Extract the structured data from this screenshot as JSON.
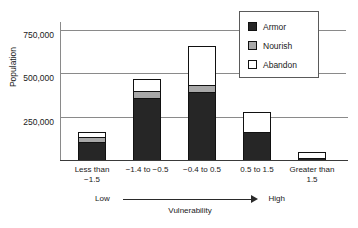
{
  "chart_data": {
    "type": "bar",
    "subtype": "stacked-bar",
    "title": "",
    "xlabel": "Vulnerability",
    "ylabel": "Population",
    "ylim": [
      0,
      800000
    ],
    "yticks": [
      250000,
      500000,
      750000
    ],
    "ytick_labels": [
      "250,000",
      "500,000",
      "750,000"
    ],
    "grid": true,
    "legend_position": "top-right",
    "categories": [
      "Less than\n−1.5",
      "−1.4 to −0.5",
      "−0.4  to 0.5",
      "0.5  to 1.5",
      "Greater than\n1.5"
    ],
    "series": [
      {
        "name": "Armor",
        "color": "#262626",
        "values": [
          105000,
          360000,
          390000,
          160000,
          10000
        ]
      },
      {
        "name": "Nourish",
        "color": "#a8a8a8",
        "values": [
          30000,
          40000,
          40000,
          0,
          0
        ]
      },
      {
        "name": "Abandon",
        "color": "#ffffff",
        "values": [
          25000,
          70000,
          230000,
          115000,
          35000
        ]
      }
    ],
    "annotations": {
      "axis_low": "Low",
      "axis_high": "High",
      "axis_arrow": "→"
    }
  },
  "axis": {
    "y_label": "Population",
    "y_ticks": [
      {
        "label": "750,000",
        "value": 750000
      },
      {
        "label": "500,000",
        "value": 500000
      },
      {
        "label": "250,000",
        "value": 250000
      }
    ],
    "x_categories": [
      {
        "line1": "Less than",
        "line2": "−1.5"
      },
      {
        "line1": "−1.4 to −0.5",
        "line2": ""
      },
      {
        "line1": "−0.4  to 0.5",
        "line2": ""
      },
      {
        "line1": "0.5  to 1.5",
        "line2": ""
      },
      {
        "line1": "Greater than",
        "line2": "1.5"
      }
    ]
  },
  "vulnerability": {
    "low": "Low",
    "high": "High",
    "caption": "Vulnerability"
  },
  "legend": {
    "items": [
      {
        "label": "Armor",
        "color": "#262626"
      },
      {
        "label": "Nourish",
        "color": "#a8a8a8"
      },
      {
        "label": "Abandon",
        "color": "#ffffff"
      }
    ]
  }
}
